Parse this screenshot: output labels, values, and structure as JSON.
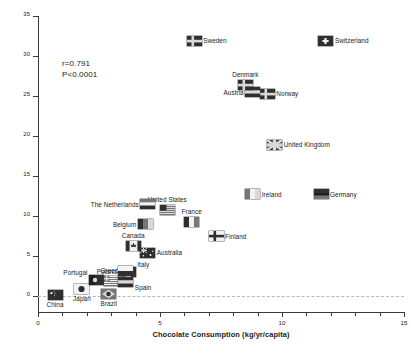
{
  "chart_data": {
    "type": "scatter",
    "title": "",
    "xlabel": "Chocolate Consumption (kg/yr/capita)",
    "ylabel": "Nobel Laureates per 10 Million Population",
    "xlim": [
      0,
      15
    ],
    "ylim": [
      -2,
      35
    ],
    "xticks": [
      0,
      5,
      10,
      15
    ],
    "xtick_labels": [
      "0",
      "5",
      "10",
      "15"
    ],
    "xminor_step": 1,
    "yticks": [
      0,
      5,
      10,
      15,
      20,
      25,
      30,
      35
    ],
    "ytick_labels": [
      "0",
      "5",
      "10",
      "15",
      "20",
      "25",
      "30",
      "35"
    ],
    "grid": false,
    "legend": "none",
    "annotations": {
      "r": "r=0.791",
      "p": "P<0.0001"
    },
    "marker_style": "country-flag",
    "points": [
      {
        "name": "China",
        "x": 0.7,
        "y": 0.1,
        "label_pos": "below"
      },
      {
        "name": "Brazil",
        "x": 2.9,
        "y": 0.2,
        "label_pos": "below"
      },
      {
        "name": "Japan",
        "x": 1.8,
        "y": 0.9,
        "label_pos": "below"
      },
      {
        "name": "Portugal",
        "x": 2.4,
        "y": 2.0,
        "label_pos": "al"
      },
      {
        "name": "Greece",
        "x": 3.0,
        "y": 1.9,
        "label_pos": "above"
      },
      {
        "name": "Spain",
        "x": 3.6,
        "y": 1.8,
        "label_pos": "br"
      },
      {
        "name": "Italy",
        "x": 3.7,
        "y": 3.0,
        "label_pos": "ar"
      },
      {
        "name": "Poland",
        "x": 3.6,
        "y": 3.1,
        "label_pos": "left"
      },
      {
        "name": "Australia",
        "x": 4.5,
        "y": 5.4,
        "label_pos": "right"
      },
      {
        "name": "Canada",
        "x": 3.9,
        "y": 6.2,
        "label_pos": "above"
      },
      {
        "name": "Finland",
        "x": 7.3,
        "y": 7.5,
        "label_pos": "right"
      },
      {
        "name": "Belgium",
        "x": 4.4,
        "y": 9.0,
        "label_pos": "left"
      },
      {
        "name": "France",
        "x": 6.3,
        "y": 9.2,
        "label_pos": "above"
      },
      {
        "name": "United States",
        "x": 5.3,
        "y": 10.8,
        "label_pos": "above"
      },
      {
        "name": "The Netherlands",
        "x": 4.5,
        "y": 11.5,
        "label_pos": "left"
      },
      {
        "name": "Ireland",
        "x": 8.8,
        "y": 12.7,
        "label_pos": "right"
      },
      {
        "name": "Germany",
        "x": 11.6,
        "y": 12.7,
        "label_pos": "right"
      },
      {
        "name": "United Kingdom",
        "x": 9.7,
        "y": 18.9,
        "label_pos": "right"
      },
      {
        "name": "Norway",
        "x": 9.4,
        "y": 25.3,
        "label_pos": "right"
      },
      {
        "name": "Austria",
        "x": 8.8,
        "y": 25.5,
        "label_pos": "left"
      },
      {
        "name": "Denmark",
        "x": 8.5,
        "y": 26.4,
        "label_pos": "above"
      },
      {
        "name": "Sweden",
        "x": 6.4,
        "y": 31.9,
        "label_pos": "right"
      },
      {
        "name": "Switzerland",
        "x": 11.8,
        "y": 31.9,
        "label_pos": "right"
      }
    ]
  }
}
